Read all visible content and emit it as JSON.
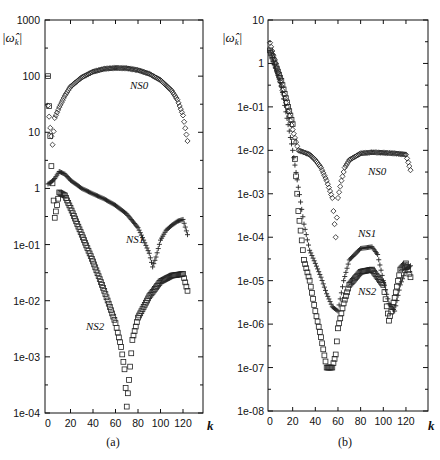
{
  "chart_data": [
    {
      "panel": "(a)",
      "type": "scatter",
      "title": "",
      "xlabel": "k",
      "ylabel": "|ω̂_k|",
      "yscale": "log",
      "xlim": [
        0,
        138
      ],
      "ylim": [
        0.0001,
        1000
      ],
      "xticks": [
        "0",
        "20",
        "40",
        "60",
        "80",
        "100",
        "120"
      ],
      "yticks": [
        "1000",
        "100",
        "10",
        "1",
        "1e-01",
        "1e-02",
        "1e-03",
        "1e-04"
      ],
      "grid": false,
      "series": [
        {
          "name": "NS0",
          "marker": "diamond",
          "x": [
            0,
            2,
            4,
            6,
            10,
            15,
            20,
            30,
            40,
            50,
            60,
            70,
            80,
            90,
            100,
            110,
            115,
            120,
            124
          ],
          "values": [
            30,
            12,
            6,
            18,
            28,
            45,
            65,
            95,
            120,
            135,
            140,
            138,
            128,
            110,
            85,
            55,
            38,
            20,
            7
          ]
        },
        {
          "name": "NS1",
          "marker": "plus",
          "x": [
            0,
            3,
            6,
            10,
            15,
            20,
            30,
            40,
            50,
            60,
            70,
            80,
            85,
            90,
            93,
            96,
            100,
            105,
            110,
            115,
            120,
            124
          ],
          "values": [
            1.2,
            1.3,
            1.5,
            2.0,
            1.8,
            1.4,
            1.0,
            0.8,
            0.65,
            0.5,
            0.35,
            0.2,
            0.12,
            0.07,
            0.04,
            0.06,
            0.12,
            0.18,
            0.22,
            0.26,
            0.28,
            0.15
          ]
        },
        {
          "name": "NS2",
          "marker": "square",
          "x": [
            0,
            3,
            6,
            10,
            15,
            20,
            30,
            40,
            50,
            60,
            65,
            68,
            70,
            75,
            80,
            90,
            100,
            110,
            120,
            124
          ],
          "values": [
            100,
            2.5,
            0.3,
            0.85,
            0.75,
            0.45,
            0.15,
            0.05,
            0.015,
            0.004,
            0.0015,
            0.0006,
            0.00013,
            0.002,
            0.005,
            0.012,
            0.022,
            0.028,
            0.03,
            0.015
          ]
        }
      ],
      "annotations": [
        "NS0",
        "NS1",
        "NS2"
      ],
      "caption": "(a)"
    },
    {
      "panel": "(b)",
      "type": "scatter",
      "title": "",
      "xlabel": "k",
      "ylabel": "|ω̂_k|",
      "yscale": "log",
      "xlim": [
        0,
        138
      ],
      "ylim": [
        1e-08,
        10
      ],
      "xticks": [
        "0",
        "20",
        "40",
        "60",
        "80",
        "100",
        "120"
      ],
      "yticks": [
        "10",
        "1",
        "1e-01",
        "1e-02",
        "1e-03",
        "1e-04",
        "1e-05",
        "1e-06",
        "1e-07",
        "1e-08"
      ],
      "grid": false,
      "series": [
        {
          "name": "NS0",
          "marker": "diamond",
          "x": [
            0,
            5,
            10,
            15,
            20,
            25,
            30,
            35,
            40,
            45,
            50,
            55,
            58,
            60,
            63,
            66,
            70,
            80,
            90,
            100,
            110,
            120,
            124
          ],
          "values": [
            3,
            1,
            0.3,
            0.1,
            0.03,
            0.01,
            0.009,
            0.008,
            0.006,
            0.004,
            0.002,
            0.0008,
            0.0001,
            0.0008,
            0.002,
            0.004,
            0.006,
            0.0085,
            0.009,
            0.0088,
            0.0085,
            0.008,
            0.0035
          ]
        },
        {
          "name": "NS1",
          "marker": "plus",
          "x": [
            0,
            10,
            20,
            30,
            35,
            40,
            45,
            50,
            55,
            60,
            65,
            70,
            80,
            90,
            95,
            100,
            105,
            110,
            115,
            120,
            124
          ],
          "values": [
            2,
            0.3,
            0.01,
            0.0002,
            5e-05,
            2.5e-05,
            1.2e-05,
            5e-06,
            2.5e-06,
            2e-06,
            1e-05,
            3e-05,
            5.5e-05,
            6e-05,
            4e-05,
            1e-05,
            3e-06,
            2e-06,
            8e-06,
            1.8e-05,
            2.2e-05
          ]
        },
        {
          "name": "NS2",
          "marker": "square",
          "x": [
            0,
            10,
            20,
            25,
            30,
            35,
            40,
            45,
            50,
            55,
            58,
            60,
            65,
            70,
            80,
            90,
            100,
            105,
            110,
            115,
            120,
            124
          ],
          "values": [
            2,
            0.4,
            0.04,
            0.0004,
            3e-05,
            1e-05,
            2e-06,
            5e-07,
            1e-07,
            1e-07,
            2e-07,
            8e-07,
            3e-06,
            8e-06,
            1.6e-05,
            1.8e-05,
            8e-06,
            1.2e-06,
            4e-06,
            1.8e-05,
            2.5e-05,
            1.2e-05
          ]
        }
      ],
      "annotations": [
        "NS0",
        "NS1",
        "NS2"
      ],
      "caption": "(b)"
    }
  ],
  "panels": {
    "a": {
      "caption": "(a)",
      "xlabel": "k",
      "ylabel_text": "|ω̂",
      "ylabel_sub": "k",
      "xticks": [
        "0",
        "20",
        "40",
        "60",
        "80",
        "100",
        "120"
      ],
      "yticks": [
        "1000",
        "100",
        "10",
        "1",
        "1e-01",
        "1e-02",
        "1e-03",
        "1e-04"
      ],
      "labels": {
        "ns0": "NS0",
        "ns1": "NS1",
        "ns2": "NS2"
      }
    },
    "b": {
      "caption": "(b)",
      "xlabel": "k",
      "ylabel_text": "|ω̂",
      "ylabel_sub": "k",
      "xticks": [
        "0",
        "20",
        "40",
        "60",
        "80",
        "100",
        "120"
      ],
      "yticks": [
        "10",
        "1",
        "1e-01",
        "1e-02",
        "1e-03",
        "1e-04",
        "1e-05",
        "1e-06",
        "1e-07",
        "1e-08"
      ],
      "labels": {
        "ns0": "NS0",
        "ns1": "NS1",
        "ns2": "NS2"
      }
    }
  }
}
